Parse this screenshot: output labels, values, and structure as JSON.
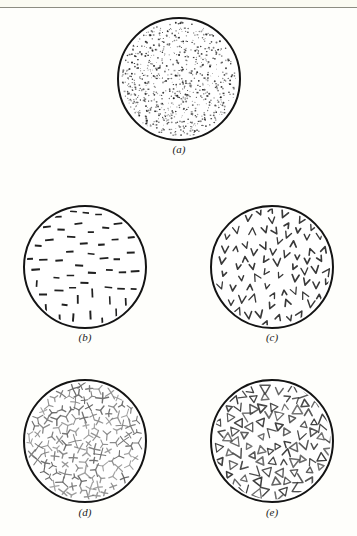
{
  "figure": {
    "page_background": "#fefefb",
    "rule_color": "#8d8d82",
    "ink_color": "#1a1a1a",
    "circle_fill": "#ffffff",
    "circle_stroke": "#141414"
  },
  "panels": [
    {
      "id": "a",
      "label": "(a)",
      "pattern": "fine-dots",
      "cx": 179,
      "cy": 79,
      "r": 61,
      "label_y": 143,
      "mark_count": 820,
      "mark_size": 1.4,
      "mark_color": "#2b2b2b",
      "description": "very fine scattered dots, denser toward lower-left"
    },
    {
      "id": "b",
      "label": "(b)",
      "pattern": "dashes",
      "cx": 85,
      "cy": 267,
      "r": 61,
      "label_y": 331,
      "mark_count": 56,
      "mark_size": 7,
      "mark_color": "#202020",
      "description": "short dashes, horizontal above transitioning to vertical below"
    },
    {
      "id": "c",
      "label": "(c)",
      "pattern": "chevrons",
      "cx": 272,
      "cy": 267,
      "r": 61,
      "label_y": 331,
      "mark_count": 74,
      "mark_size": 6,
      "mark_color": "#3a3a3a",
      "description": "small v-shaped chevrons in varied rotations"
    },
    {
      "id": "d",
      "label": "(d)",
      "pattern": "asterisks",
      "cx": 85,
      "cy": 441,
      "r": 61,
      "label_y": 506,
      "mark_count": 118,
      "mark_size": 5,
      "mark_color": "#6a6a6a",
      "description": "small three and four pronged star clusters"
    },
    {
      "id": "e",
      "label": "(e)",
      "pattern": "triangles",
      "cx": 272,
      "cy": 441,
      "r": 61,
      "label_y": 506,
      "mark_count": 104,
      "mark_size": 7,
      "mark_color": "#3c3c3c",
      "description": "open triangle and arrowhead outlines, randomly rotated"
    }
  ]
}
